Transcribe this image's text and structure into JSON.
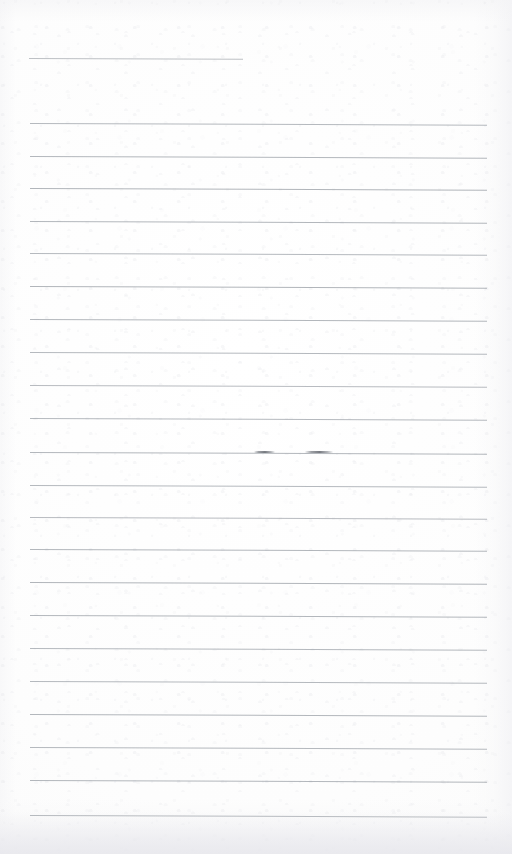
{
  "document": {
    "kind": "scanned-blank-lined-page",
    "page_width": 512,
    "page_height": 854,
    "background_color": "#fdfdfd",
    "rule_color": "#969ba2",
    "ink_mark_color": "#565a62",
    "text_content": "",
    "visible_text_lines": []
  },
  "ruling": {
    "line_count": 24,
    "line_spacing_px": 32.4,
    "left_margin_px": 29,
    "right_margin_px": 487,
    "first_line_y_px": 58,
    "last_line_y_px": 815,
    "tilt_deg": 0.22,
    "lines": [
      {
        "index": 1,
        "y": 58,
        "x_start": 29,
        "x_end": 243,
        "short": true,
        "opacity": 0.62
      },
      {
        "index": 2,
        "y": 123,
        "x_start": 30,
        "x_end": 487,
        "short": false,
        "opacity": 0.7
      },
      {
        "index": 3,
        "y": 156,
        "x_start": 30,
        "x_end": 487,
        "short": false,
        "opacity": 0.72
      },
      {
        "index": 4,
        "y": 188,
        "x_start": 30,
        "x_end": 487,
        "short": false,
        "opacity": 0.74
      },
      {
        "index": 5,
        "y": 221,
        "x_start": 30,
        "x_end": 487,
        "short": false,
        "opacity": 0.72
      },
      {
        "index": 6,
        "y": 253,
        "x_start": 30,
        "x_end": 487,
        "short": false,
        "opacity": 0.7
      },
      {
        "index": 7,
        "y": 286,
        "x_start": 30,
        "x_end": 487,
        "short": false,
        "opacity": 0.74
      },
      {
        "index": 8,
        "y": 319,
        "x_start": 30,
        "x_end": 487,
        "short": false,
        "opacity": 0.72
      },
      {
        "index": 9,
        "y": 352,
        "x_start": 30,
        "x_end": 487,
        "short": false,
        "opacity": 0.7
      },
      {
        "index": 10,
        "y": 385,
        "x_start": 30,
        "x_end": 487,
        "short": false,
        "opacity": 0.68
      },
      {
        "index": 11,
        "y": 418,
        "x_start": 30,
        "x_end": 487,
        "short": false,
        "opacity": 0.7
      },
      {
        "index": 12,
        "y": 452,
        "x_start": 30,
        "x_end": 487,
        "short": false,
        "opacity": 0.72
      },
      {
        "index": 13,
        "y": 485,
        "x_start": 30,
        "x_end": 487,
        "short": false,
        "opacity": 0.7
      },
      {
        "index": 14,
        "y": 517,
        "x_start": 30,
        "x_end": 487,
        "short": false,
        "opacity": 0.68
      },
      {
        "index": 15,
        "y": 549,
        "x_start": 30,
        "x_end": 487,
        "short": false,
        "opacity": 0.72
      },
      {
        "index": 16,
        "y": 582,
        "x_start": 30,
        "x_end": 487,
        "short": false,
        "opacity": 0.74
      },
      {
        "index": 17,
        "y": 615,
        "x_start": 30,
        "x_end": 487,
        "short": false,
        "opacity": 0.72
      },
      {
        "index": 18,
        "y": 648,
        "x_start": 30,
        "x_end": 487,
        "short": false,
        "opacity": 0.7
      },
      {
        "index": 19,
        "y": 681,
        "x_start": 30,
        "x_end": 487,
        "short": false,
        "opacity": 0.7
      },
      {
        "index": 20,
        "y": 714,
        "x_start": 30,
        "x_end": 487,
        "short": false,
        "opacity": 0.72
      },
      {
        "index": 21,
        "y": 747,
        "x_start": 30,
        "x_end": 487,
        "short": false,
        "opacity": 0.7
      },
      {
        "index": 22,
        "y": 780,
        "x_start": 30,
        "x_end": 487,
        "short": false,
        "opacity": 0.72
      },
      {
        "index": 23,
        "y": 815,
        "x_start": 30,
        "x_end": 487,
        "short": false,
        "opacity": 0.74
      }
    ]
  },
  "marks": [
    {
      "name": "ink-smudge-left",
      "on_line_index": 12,
      "y": 451,
      "x_start": 254,
      "x_end": 275
    },
    {
      "name": "ink-smudge-right",
      "on_line_index": 12,
      "y": 451,
      "x_start": 305,
      "x_end": 333
    }
  ]
}
